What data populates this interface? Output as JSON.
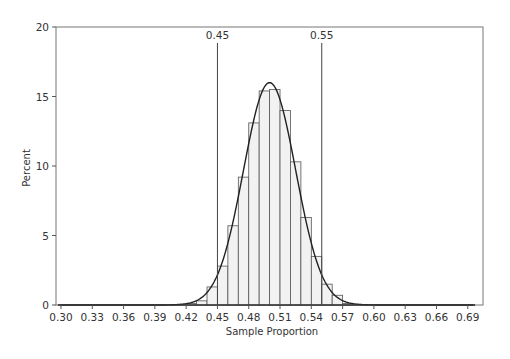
{
  "chart_data": {
    "type": "bar",
    "title": "",
    "xlabel": "Sample Proportion",
    "ylabel": "Percent",
    "xlim": [
      0.295,
      0.7
    ],
    "ylim": [
      0,
      20
    ],
    "x_ticks": [
      "0.30",
      "0.33",
      "0.36",
      "0.39",
      "0.42",
      "0.45",
      "0.48",
      "0.51",
      "0.54",
      "0.57",
      "0.60",
      "0.63",
      "0.66",
      "0.69"
    ],
    "x_tick_values": [
      0.3,
      0.33,
      0.36,
      0.39,
      0.42,
      0.45,
      0.48,
      0.51,
      0.54,
      0.57,
      0.6,
      0.63,
      0.66,
      0.69
    ],
    "y_ticks": [
      "0",
      "5",
      "10",
      "15",
      "20"
    ],
    "y_tick_values": [
      0,
      5,
      10,
      15,
      20
    ],
    "bin_width": 0.01,
    "bins": [
      {
        "start": 0.42,
        "value": 0.1
      },
      {
        "start": 0.43,
        "value": 0.3
      },
      {
        "start": 0.44,
        "value": 1.3
      },
      {
        "start": 0.45,
        "value": 2.8
      },
      {
        "start": 0.46,
        "value": 5.7
      },
      {
        "start": 0.47,
        "value": 9.2
      },
      {
        "start": 0.48,
        "value": 13.1
      },
      {
        "start": 0.49,
        "value": 15.4
      },
      {
        "start": 0.5,
        "value": 15.5
      },
      {
        "start": 0.51,
        "value": 14.0
      },
      {
        "start": 0.52,
        "value": 10.3
      },
      {
        "start": 0.53,
        "value": 6.3
      },
      {
        "start": 0.54,
        "value": 3.5
      },
      {
        "start": 0.55,
        "value": 1.5
      },
      {
        "start": 0.56,
        "value": 0.7
      },
      {
        "start": 0.57,
        "value": 0.1
      }
    ],
    "normal_curve": {
      "mean": 0.5,
      "sd": 0.025,
      "peak_percent": 16.0
    },
    "reference_lines": [
      {
        "x": 0.45,
        "label": "0.45"
      },
      {
        "x": 0.55,
        "label": "0.55"
      }
    ],
    "grid": false,
    "legend": "none",
    "colors": {
      "bar_fill": "#f2f2f2",
      "bar_stroke": "#555555",
      "curve": "#222222",
      "axis": "#555555"
    }
  }
}
